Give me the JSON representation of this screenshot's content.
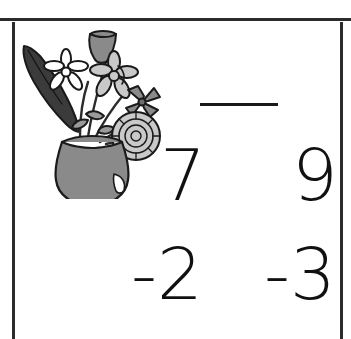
{
  "page": {
    "kind": "math-worksheet-scan",
    "background_color": "#ffffff",
    "ink_color": "#1a1a1a",
    "width": 351,
    "height": 339
  },
  "borders": {
    "top_rule": "horizontal-rule",
    "left_rule": "vertical-rule",
    "right_rule": "vertical-rule"
  },
  "clipart": {
    "name": "vase-with-flowers",
    "description": "Gray pottery vase holding daisies, a tulip, a chrysanthemum and a dark leaf",
    "colors": {
      "vase_fill": "#8a8a8a",
      "petal_fill": "#c9c9c9",
      "leaf_fill": "#3b3b3b",
      "outline": "#1a1a1a"
    }
  },
  "problems": [
    {
      "id": "problem-1",
      "minuend": "7",
      "operator_and_subtrahend": "-2",
      "answer": "",
      "has_answer_line": true
    },
    {
      "id": "problem-2",
      "minuend": "9",
      "operator_and_subtrahend": "-3",
      "answer": "",
      "has_answer_line": false
    }
  ]
}
